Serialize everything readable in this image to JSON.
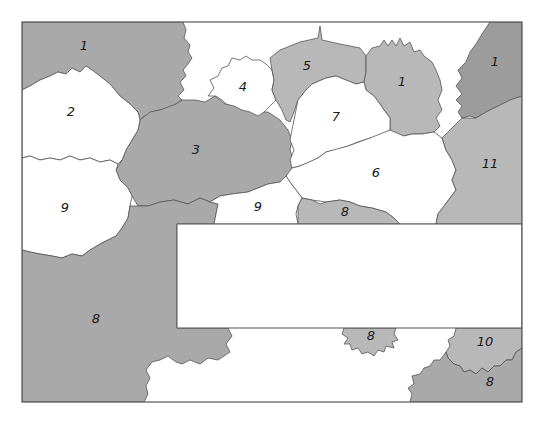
{
  "map": {
    "frame": {
      "x": 22,
      "y": 22,
      "width": 500,
      "height": 380,
      "border_color": "#555555"
    },
    "inset_box": {
      "x": 177,
      "y": 224,
      "width": 345,
      "height": 104,
      "fill": "#ffffff"
    },
    "colors": {
      "shaded": "#a9a9a9",
      "shaded_light": "#b8b8b8",
      "shaded_dark": "#9c9c9c",
      "unshaded": "#ffffff",
      "outline": "#555555"
    },
    "regions": [
      {
        "label": "1",
        "shade": "gray",
        "x": 84,
        "y": 46
      },
      {
        "label": "2",
        "shade": "white",
        "x": 71,
        "y": 112
      },
      {
        "label": "4",
        "shade": "white",
        "x": 243,
        "y": 87
      },
      {
        "label": "5",
        "shade": "gray",
        "x": 307,
        "y": 66
      },
      {
        "label": "1",
        "shade": "gray",
        "x": 402,
        "y": 82
      },
      {
        "label": "1",
        "shade": "gray",
        "x": 495,
        "y": 62
      },
      {
        "label": "7",
        "shade": "white",
        "x": 336,
        "y": 117
      },
      {
        "label": "3",
        "shade": "gray",
        "x": 196,
        "y": 150
      },
      {
        "label": "6",
        "shade": "white",
        "x": 376,
        "y": 173
      },
      {
        "label": "11",
        "shade": "gray",
        "x": 490,
        "y": 164
      },
      {
        "label": "9",
        "shade": "white",
        "x": 65,
        "y": 208
      },
      {
        "label": "9",
        "shade": "white",
        "x": 258,
        "y": 207
      },
      {
        "label": "8",
        "shade": "gray",
        "x": 345,
        "y": 212
      },
      {
        "label": "8",
        "shade": "gray",
        "x": 96,
        "y": 319
      },
      {
        "label": "8",
        "shade": "gray",
        "x": 371,
        "y": 336
      },
      {
        "label": "10",
        "shade": "gray",
        "x": 485,
        "y": 342
      },
      {
        "label": "8",
        "shade": "gray",
        "x": 490,
        "y": 382
      }
    ]
  }
}
